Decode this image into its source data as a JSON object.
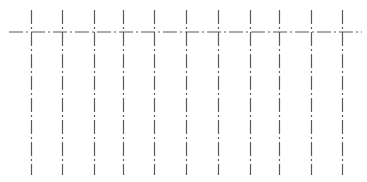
{
  "diagram": {
    "title": "",
    "stroke_color": "#5a5a5a",
    "background": "#ffffff",
    "dash_pattern": "14 3 2 3",
    "horizontal_line": {
      "y": 32,
      "x1": 9,
      "x2": 362
    },
    "vertical_lines": {
      "y1": 10,
      "y2": 175,
      "x_positions": [
        31,
        62,
        94,
        123,
        154,
        186,
        218,
        250,
        279,
        311,
        342
      ]
    }
  }
}
